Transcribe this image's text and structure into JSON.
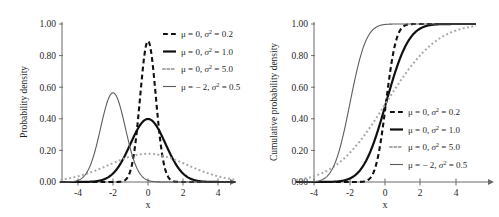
{
  "figure": {
    "title": "",
    "background": "#ffffff"
  },
  "panels": [
    {
      "id": "pdf",
      "name": "probability-density-panel",
      "ylabel": "Probability density",
      "xlabel": "x",
      "ytick_labels": [
        "0.00",
        "0.20",
        "0.40",
        "0.60",
        "0.80",
        "1.00"
      ],
      "xtick_labels": [
        "-4",
        "-2",
        "0",
        "2",
        "4"
      ],
      "legend_position": "top-right"
    },
    {
      "id": "cdf",
      "name": "cumulative-probability-density-panel",
      "ylabel": "Cumulative probability density",
      "xlabel": "x",
      "ytick_labels": [
        "0.00",
        "0.20",
        "0.40",
        "0.60",
        "0.80",
        "1.00"
      ],
      "xtick_labels": [
        "-4",
        "-2",
        "0",
        "2",
        "4"
      ],
      "legend_position": "middle-right"
    }
  ],
  "legend": {
    "entries": [
      {
        "mu_text": "μ = 0,",
        "sigma_text": "σ",
        "sup": "2",
        "value_text": "= 0.2",
        "style": "dashed",
        "color": "#101010",
        "width": 2.1
      },
      {
        "mu_text": "μ = 0,",
        "sigma_text": "σ",
        "sup": "2",
        "value_text": "= 1.0",
        "style": "solid",
        "color": "#101010",
        "width": 2.2
      },
      {
        "mu_text": "μ = 0,",
        "sigma_text": "σ",
        "sup": "2",
        "value_text": "= 5.0",
        "style": "dotted",
        "color": "#a8a8a8",
        "width": 2.0
      },
      {
        "mu_text": "μ = − 2,",
        "sigma_text": "σ",
        "sup": "2",
        "value_text": "= 0.5",
        "style": "solid",
        "color": "#5d5d5d",
        "width": 1.1
      }
    ]
  },
  "chart_data": {
    "type": "line",
    "panel_count": 2,
    "xlabel": "x",
    "xlim": [
      -5,
      5
    ],
    "ylim": [
      0,
      1.0
    ],
    "xticks": [
      -4,
      -2,
      0,
      2,
      4
    ],
    "yticks": [
      0.0,
      0.2,
      0.4,
      0.6,
      0.8,
      1.0
    ],
    "grid": false,
    "legend": [
      "μ = 0, σ² = 0.2",
      "μ = 0, σ² = 1.0",
      "μ = 0, σ² = 5.0",
      "μ = −2, σ² = 0.5"
    ],
    "panels": [
      {
        "name": "pdf",
        "ylabel": "Probability density",
        "series": [
          {
            "name": "μ = 0, σ² = 0.2",
            "mu": 0,
            "var": 0.2,
            "peak": 0.892,
            "style": "dashed",
            "color": "#101010"
          },
          {
            "name": "μ = 0, σ² = 1.0",
            "mu": 0,
            "var": 1.0,
            "peak": 0.399,
            "style": "solid",
            "color": "#101010"
          },
          {
            "name": "μ = 0, σ² = 5.0",
            "mu": 0,
            "var": 5.0,
            "peak": 0.178,
            "style": "dotted",
            "color": "#a8a8a8"
          },
          {
            "name": "μ = −2, σ² = 0.5",
            "mu": -2,
            "var": 0.5,
            "peak": 0.564,
            "style": "solid",
            "color": "#5d5d5d"
          }
        ]
      },
      {
        "name": "cdf",
        "ylabel": "Cumulative probability density",
        "series": [
          {
            "name": "μ = 0, σ² = 0.2",
            "mu": 0,
            "var": 0.2,
            "style": "dashed",
            "color": "#101010"
          },
          {
            "name": "μ = 0, σ² = 1.0",
            "mu": 0,
            "var": 1.0,
            "style": "solid",
            "color": "#101010"
          },
          {
            "name": "μ = 0, σ² = 5.0",
            "mu": 0,
            "var": 5.0,
            "style": "dotted",
            "color": "#a8a8a8"
          },
          {
            "name": "μ = −2, σ² = 0.5",
            "mu": -2,
            "var": 0.5,
            "style": "solid",
            "color": "#5d5d5d"
          }
        ]
      }
    ]
  }
}
